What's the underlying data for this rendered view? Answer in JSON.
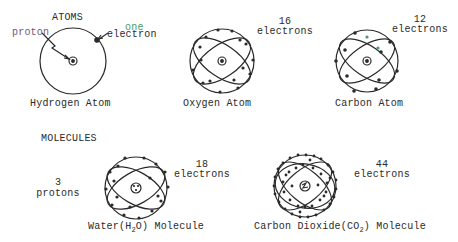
{
  "sections": {
    "atoms_heading": "ATOMS",
    "molecules_heading": "MOLECULES"
  },
  "atoms": [
    {
      "name": "Hydrogen Atom",
      "labels": {
        "proton": "proton",
        "electron_count": "one",
        "electron_word": "electron"
      },
      "electrons": 1
    },
    {
      "name": "Oxygen Atom",
      "labels": {
        "count": "16",
        "word": "electrons"
      },
      "electrons": 16
    },
    {
      "name": "Carbon Atom",
      "labels": {
        "count": "12",
        "word": "electrons"
      },
      "electrons": 12
    }
  ],
  "molecules": [
    {
      "name_prefix": "Water(H",
      "subscript": "2",
      "name_suffix": "O) Molecule",
      "labels": {
        "count": "18",
        "word": "electrons",
        "proton_count": "3",
        "proton_word": "protons"
      },
      "electrons": 18
    },
    {
      "name_prefix": "Carbon Dioxide(CO",
      "subscript": "2",
      "name_suffix": ") Molecule",
      "labels": {
        "count": "44",
        "word": "electrons"
      },
      "electrons": 44
    }
  ],
  "colors": {
    "ink": "#2a2a2a",
    "annotation_green": "#4a9a6a",
    "annotation_purple": "#6a5a7a"
  }
}
